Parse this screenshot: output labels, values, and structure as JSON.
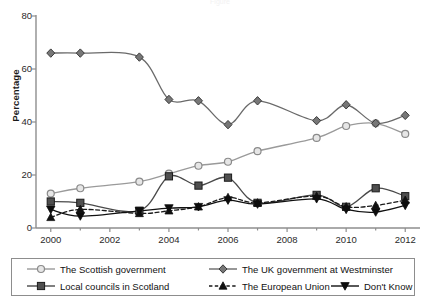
{
  "title_fragment": "Figure",
  "axes": {
    "ylabel": "Percentage",
    "yticks": [
      "0",
      "20",
      "40",
      "60",
      "80"
    ],
    "xticks": [
      "2000",
      "2002",
      "2004",
      "2006",
      "2008",
      "2010",
      "2012"
    ]
  },
  "legend": {
    "items": [
      {
        "label": "The Scottish government",
        "icon": "open-circle-marker-icon",
        "color": "#9a9a9a"
      },
      {
        "label": "Local councils in Scotland",
        "icon": "filled-square-marker-icon",
        "color": "#4a4a4a"
      },
      {
        "label": "The UK government at Westminster",
        "icon": "filled-diamond-marker-icon",
        "color": "#6a6a6a"
      },
      {
        "label": "The European Union",
        "icon": "filled-triangle-up-marker-icon",
        "color": "#1a1a1a"
      },
      {
        "label": "Don't Know",
        "icon": "filled-triangle-down-marker-icon",
        "color": "#111111"
      }
    ]
  },
  "chart_data": {
    "type": "line",
    "title": "",
    "xlabel": "",
    "ylabel": "Percentage",
    "xlim": [
      1999.5,
      2012.5
    ],
    "ylim": [
      0,
      80
    ],
    "grid": false,
    "legend_position": "bottom",
    "x": [
      2000,
      2001,
      2003,
      2004,
      2005,
      2006,
      2007,
      2009,
      2010,
      2011,
      2012
    ],
    "series": [
      {
        "name": "The Scottish government",
        "marker": "open-circle",
        "color": "#9a9a9a",
        "linestyle": "solid",
        "values": [
          13,
          15,
          17.5,
          20.5,
          23.5,
          25,
          29,
          34,
          38.5,
          39.5,
          35.5
        ]
      },
      {
        "name": "Local councils in Scotland",
        "marker": "filled-square",
        "color": "#4a4a4a",
        "linestyle": "solid",
        "values": [
          10,
          9.5,
          6.5,
          19.5,
          16,
          19,
          9.5,
          12.5,
          8,
          15,
          12
        ]
      },
      {
        "name": "The UK government at Westminster",
        "marker": "filled-diamond",
        "color": "#6a6a6a",
        "linestyle": "solid",
        "values": [
          66,
          66,
          64.5,
          48.5,
          48,
          39,
          48,
          40.5,
          46.5,
          39.5,
          42.5
        ]
      },
      {
        "name": "The European Union",
        "marker": "filled-triangle-up",
        "color": "#1a1a1a",
        "linestyle": "dashed",
        "values": [
          4,
          7,
          5.5,
          6.5,
          8,
          11.5,
          9.5,
          12,
          8,
          8.5,
          10.5
        ]
      },
      {
        "name": "Don't Know",
        "marker": "filled-triangle-down",
        "color": "#111111",
        "linestyle": "solid",
        "values": [
          7,
          4.5,
          6.5,
          7.5,
          8,
          10.5,
          9,
          11,
          7,
          6,
          8.5
        ]
      }
    ]
  }
}
